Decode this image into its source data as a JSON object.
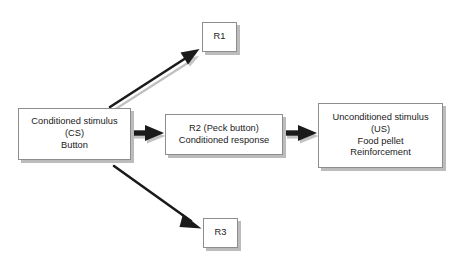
{
  "diagram": {
    "background_color": "#ffffff",
    "box_border_color": "#8d8d8d",
    "box_shadow_color": "#bcbcbc",
    "arrow_color": "#1a1a1a",
    "arrow_shadow_color": "#b9b9b9",
    "text_color": "#1b1b1b",
    "nodes": {
      "cs": {
        "id": "conditioned-stimulus",
        "lines": [
          "Conditioned stimulus",
          "(CS)",
          "Button"
        ]
      },
      "r2": {
        "id": "r2-peck-button",
        "lines": [
          "R2 (Peck button)",
          "Conditioned response"
        ]
      },
      "us": {
        "id": "unconditioned-stimulus",
        "lines": [
          "Unconditioned stimulus",
          "(US)",
          "Food pellet",
          "Reinforcement"
        ]
      },
      "r1": {
        "id": "r1",
        "lines": [
          "R1"
        ]
      },
      "r3": {
        "id": "r3",
        "lines": [
          "R3"
        ]
      }
    },
    "arrows": [
      {
        "id": "cs-to-r1",
        "from": "cs",
        "to": "r1",
        "label": "",
        "direction": "up-right"
      },
      {
        "id": "cs-to-r2",
        "from": "cs",
        "to": "r2",
        "label": "",
        "direction": "right"
      },
      {
        "id": "cs-to-r3",
        "from": "cs",
        "to": "r3",
        "label": "",
        "direction": "down-right"
      },
      {
        "id": "r2-to-us",
        "from": "r2",
        "to": "us",
        "label": "",
        "direction": "right"
      }
    ]
  }
}
